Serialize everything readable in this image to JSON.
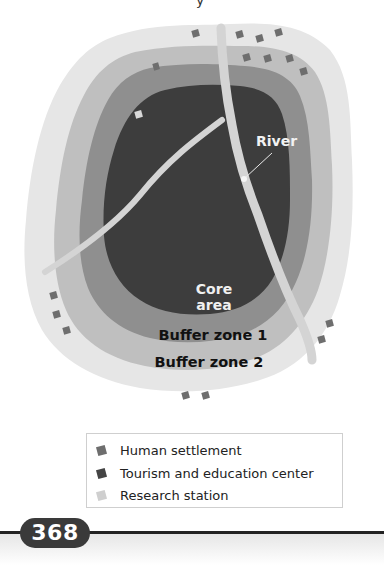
{
  "diagram": {
    "partial_top_glyph": "y",
    "labels": {
      "river": "River",
      "core_line1": "Core",
      "core_line2": "area",
      "buffer_zone_1": "Buffer zone 1",
      "buffer_zone_2": "Buffer zone 2"
    },
    "zone_colors": {
      "outer_ring": "#e6e6e6",
      "buffer_zone_2": "#bfbfbf",
      "buffer_zone_1": "#8f8f8f",
      "core_area": "#3d3d3d",
      "river": "#d4d4d4"
    },
    "markers": {
      "human_settlement_count": 17,
      "research_station_count": 1
    }
  },
  "legend": {
    "items": [
      {
        "label": "Human settlement",
        "icon": "settlement-square-icon",
        "color": "#6e6e6e"
      },
      {
        "label": "Tourism and education center",
        "icon": "tourism-square-icon",
        "color": "#444444"
      },
      {
        "label": "Research station",
        "icon": "research-square-icon",
        "color": "#cfcfcf"
      }
    ]
  },
  "footer": {
    "page_number": "368"
  }
}
